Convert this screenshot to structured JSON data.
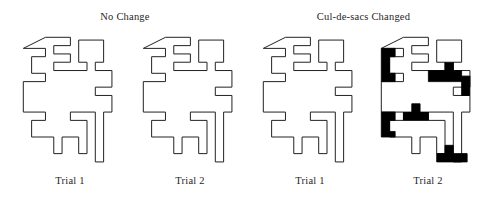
{
  "figure": {
    "title_no_change": "No Change",
    "title_culdesacs_changed": "Cul-de-sacs Changed",
    "background_color": "#ffffff",
    "outline_color": "#222222",
    "fill_color": "#ffffff",
    "highlight_color": "#000000"
  },
  "groups": [
    {
      "id": "no-change",
      "label": "No Change",
      "panels": [
        {
          "id": "panel-0",
          "caption": "Trial 1",
          "highlighted": false
        },
        {
          "id": "panel-1",
          "caption": "Trial 2",
          "highlighted": false
        }
      ]
    },
    {
      "id": "culdesacs-changed",
      "label": "Cul-de-sacs Changed",
      "panels": [
        {
          "id": "panel-2",
          "caption": "Trial 1",
          "highlighted": false
        },
        {
          "id": "panel-3",
          "caption": "Trial 2",
          "highlighted": true
        }
      ]
    }
  ],
  "captions": {
    "panel_0": "Trial 1",
    "panel_1": "Trial 2",
    "panel_2": "Trial 1",
    "panel_3": "Trial 2"
  },
  "shape": {
    "description": "Meandering cross / Greek-key labyrinth outline, identical across all four panels",
    "outline_path": "M 6,10 L 22,10 L 22,16 L 12,16 L 12,28 L 22,28 L 22,34 L 6,34 L 6,56 L 22,56 L 22,62 L 12,62 L 12,74 L 28,74 L 28,86 L 34,86 L 34,74 L 46,74 L 46,86 L 52,86 L 52,62 L 40,62 L 40,56 L 58,56 L 58,92 L 64,92 L 64,56 L 70,56 L 70,44 L 58,44 L 58,38 L 70,38 L 70,26 L 58,26 L 58,20 L 64,20 L 64,4 L 46,4 L 46,20 L 52,20 L 52,26 L 28,26 L 28,20 L 40,20 L 40,14 L 28,14 L 28,8 L 40,8 L 40,2 L 22,2 Z",
    "cul_de_sac_arms": [
      {
        "name": "upper-left-arm",
        "state_trial1": "open",
        "state_trial2": "filled"
      },
      {
        "name": "mid-upper-right-arm",
        "state_trial1": "open",
        "state_trial2": "filled"
      },
      {
        "name": "far-right-arm",
        "state_trial1": "open",
        "state_trial2": "filled"
      },
      {
        "name": "mid-left-arm",
        "state_trial1": "open",
        "state_trial2": "filled"
      },
      {
        "name": "center-arm",
        "state_trial1": "open",
        "state_trial2": "filled"
      },
      {
        "name": "bottom-stem",
        "state_trial1": "open",
        "state_trial2": "filled"
      }
    ]
  }
}
